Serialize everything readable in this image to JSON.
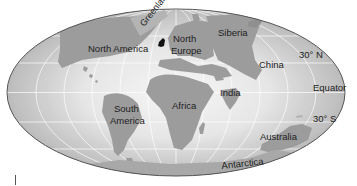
{
  "map": {
    "projection": "mollweide",
    "colors": {
      "ocean_center": "#f4f4f4",
      "ocean_edge": "#bdbdbd",
      "land": "#9c9c9c",
      "land_light": "#b4b4b4",
      "grid": "#ffffff",
      "outline": "#555555",
      "greenland_marker": "#111111"
    },
    "labels": {
      "greenland": "Greenland",
      "north_america": "North America",
      "north_europe_1": "North",
      "north_europe_2": "Europe",
      "siberia": "Siberia",
      "china": "China",
      "lat_30n": "30° N",
      "equator": "Equator",
      "lat_30s": "30° S",
      "south_america_1": "South",
      "south_america_2": "America",
      "africa": "Africa",
      "india": "India",
      "australia": "Australia",
      "antarctica": "Antarctica"
    }
  }
}
